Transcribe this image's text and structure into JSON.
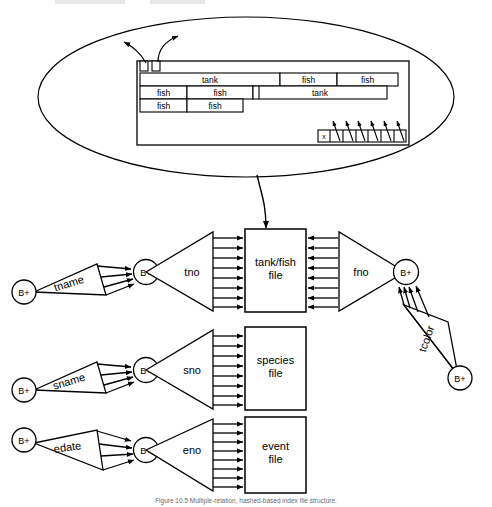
{
  "figure": {
    "caption": "Figure 10.5   Multiple-relation, hashed-based index file structure.",
    "colors": {
      "stroke": "#000000",
      "background": "#ffffff",
      "caption": "#6a6a6a"
    }
  },
  "detail_callout": {
    "shape": "ellipse",
    "description": "Zoomed block/page detail showing tuple slots and a slot directory",
    "pointer_cells": [
      {
        "name": "slot-pointer-1",
        "label": ""
      },
      {
        "name": "slot-pointer-2",
        "label": ""
      }
    ],
    "callout_arrows": [
      {
        "name": "callout-arrow-left",
        "direction": "up-left"
      },
      {
        "name": "callout-arrow-right",
        "direction": "up-right"
      }
    ],
    "rows": [
      {
        "name": "row-1",
        "cells": [
          {
            "label": "tank"
          },
          {
            "label": "fish"
          },
          {
            "label": "fish"
          }
        ]
      },
      {
        "name": "row-2",
        "cells": [
          {
            "label": "fish"
          },
          {
            "label": "fish"
          },
          {
            "label": "tank"
          }
        ]
      },
      {
        "name": "row-3",
        "cells": [
          {
            "label": "fish"
          },
          {
            "label": "fish"
          }
        ]
      }
    ],
    "slot_directory": {
      "name": "slot-directory",
      "first_cell_label": "x",
      "pointer_slot_count": 6
    }
  },
  "pipelines": [
    {
      "id": "tank-fish",
      "secondary_index": {
        "label": "tname",
        "name": "tname-triangle"
      },
      "secondary_root": {
        "label": "B+",
        "name": "bplus-node-tname-root"
      },
      "primary_root": {
        "label": "B+",
        "name": "bplus-node-tno"
      },
      "primary_index": {
        "label": "tno",
        "name": "tno-triangle"
      },
      "file": {
        "label_line1": "tank/fish",
        "label_line2": "file",
        "name": "tank-fish-file-box"
      },
      "bucket_arrow_count": 8,
      "right_index": {
        "label": "fno",
        "name": "fno-triangle"
      },
      "right_root": {
        "label": "B+",
        "name": "bplus-node-fno"
      },
      "right_secondary_index": {
        "label": "tcolor",
        "name": "tcolor-triangle"
      },
      "right_secondary_root": {
        "label": "B+",
        "name": "bplus-node-tcolor-root"
      },
      "right_bucket_arrow_count": 8
    },
    {
      "id": "species",
      "secondary_index": {
        "label": "sname",
        "name": "sname-triangle"
      },
      "secondary_root": {
        "label": "B+",
        "name": "bplus-node-sname-root"
      },
      "primary_root": {
        "label": "B+",
        "name": "bplus-node-sno"
      },
      "primary_index": {
        "label": "sno",
        "name": "sno-triangle"
      },
      "file": {
        "label_line1": "species",
        "label_line2": "file",
        "name": "species-file-box"
      },
      "bucket_arrow_count": 8
    },
    {
      "id": "event",
      "secondary_index": {
        "label": "edate",
        "name": "edate-triangle"
      },
      "secondary_root": {
        "label": "B+",
        "name": "bplus-node-edate-root"
      },
      "primary_root": {
        "label": "B+",
        "name": "bplus-node-eno"
      },
      "primary_index": {
        "label": "eno",
        "name": "eno-triangle"
      },
      "file": {
        "label_line1": "event",
        "label_line2": "file",
        "name": "event-file-box"
      },
      "bucket_arrow_count": 8
    }
  ]
}
